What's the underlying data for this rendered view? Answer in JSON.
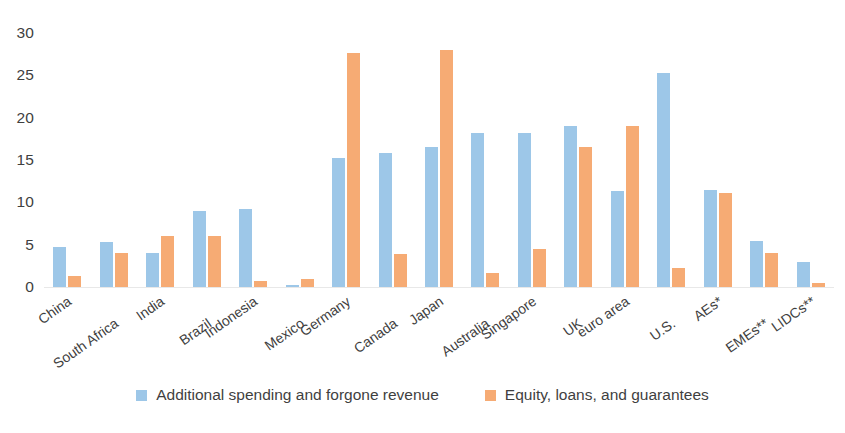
{
  "chart_data": {
    "type": "bar",
    "title": "",
    "subtitle": "",
    "xlabel": "",
    "ylabel": "",
    "ylim": [
      0,
      30
    ],
    "yticks": [
      0,
      5,
      10,
      15,
      20,
      25,
      30
    ],
    "ytick_labels": [
      "0",
      "5",
      "10",
      "15",
      "20",
      "25",
      "30"
    ],
    "grid": false,
    "legend_position": "bottom-center",
    "categories": [
      "China",
      "South Africa",
      "India",
      "Brazil",
      "Indonesia",
      "Mexico",
      "Germany",
      "Canada",
      "Japan",
      "Australia",
      "Singapore",
      "UK",
      "euro area",
      "U.S.",
      "AEs*",
      "EMEs**",
      "LIDCs**"
    ],
    "series": [
      {
        "name": "Additional spending and forgone revenue",
        "color": "#9dc7e8",
        "values": [
          4.7,
          5.3,
          4.0,
          9.0,
          9.2,
          0.2,
          15.2,
          15.8,
          16.5,
          18.2,
          18.2,
          19.0,
          11.3,
          25.3,
          11.4,
          5.4,
          2.9
        ]
      },
      {
        "name": "Equity, loans, and guarantees",
        "color": "#f6ab74",
        "values": [
          1.3,
          4.0,
          6.0,
          6.0,
          0.7,
          1.0,
          27.6,
          3.9,
          28.0,
          1.6,
          4.5,
          16.5,
          19.0,
          2.2,
          11.1,
          4.0,
          0.5
        ]
      }
    ]
  },
  "legend": {
    "items": [
      {
        "label": "Additional spending and forgone revenue",
        "swatch": "blue"
      },
      {
        "label": "Equity, loans, and guarantees",
        "swatch": "orange"
      }
    ]
  }
}
